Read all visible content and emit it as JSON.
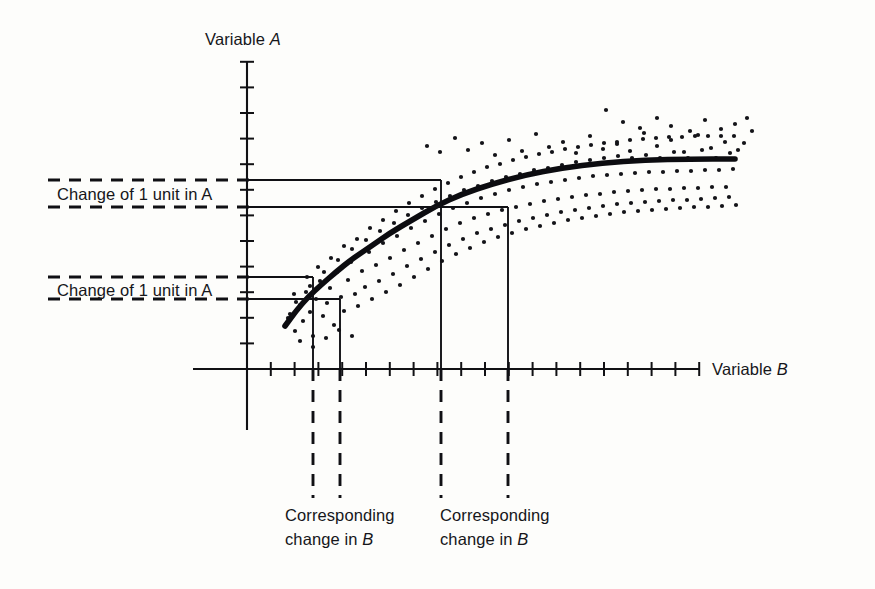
{
  "figure": {
    "background_color": "#fdfdfb",
    "ink_color": "#111114",
    "axis": {
      "y_label_prefix": "Variable ",
      "y_label_var": "A",
      "x_label_prefix": "Variable ",
      "x_label_var": "B"
    },
    "annotations": {
      "change_a_upper": "Change of 1 unit in A",
      "change_a_lower": "Change of 1 unit in A",
      "change_b_left_line1": "Corresponding",
      "change_b_left_line2_prefix": "change in ",
      "change_b_left_line2_var": "B",
      "change_b_right_line1": "Corresponding",
      "change_b_right_line2_prefix": "change in ",
      "change_b_right_line2_var": "B"
    }
  },
  "chart_data": {
    "type": "scatter",
    "title": "",
    "xlabel": "Variable B",
    "ylabel": "Variable A",
    "grid": false,
    "legend": false,
    "axis_style": "arrowless-ticked-cartesian",
    "x_axis": {
      "origin_px": 247,
      "end_px": 700,
      "tick_count": 19,
      "tick_spacing_px": 23.8,
      "tick_labels": []
    },
    "y_axis": {
      "origin_px": 369,
      "top_px": 62,
      "tick_count": 12,
      "tick_spacing_px": 25.6,
      "tick_labels": []
    },
    "fitted_curve": {
      "kind": "logarithmic",
      "points_px": [
        [
          285,
          326
        ],
        [
          296,
          311
        ],
        [
          308,
          297
        ],
        [
          321,
          285
        ],
        [
          336,
          272
        ],
        [
          352,
          259
        ],
        [
          370,
          247
        ],
        [
          390,
          233
        ],
        [
          412,
          220
        ],
        [
          436,
          206
        ],
        [
          462,
          194
        ],
        [
          492,
          184
        ],
        [
          525,
          175
        ],
        [
          562,
          168
        ],
        [
          602,
          163
        ],
        [
          645,
          160
        ],
        [
          690,
          159
        ],
        [
          735,
          159
        ]
      ]
    },
    "construction_lines": {
      "horizontal_levels_px": [
        180,
        207,
        277,
        299
      ],
      "vertical_drops_px": [
        313,
        340,
        441,
        508
      ],
      "left_pair_delta_b_px": 27,
      "right_pair_delta_b_px": 67,
      "note": "equal delta-A on the two bracketed pairs; delta-B is far larger on the right"
    },
    "scatter_points_px": [
      [
        288,
        318
      ],
      [
        295,
        331
      ],
      [
        300,
        305
      ],
      [
        303,
        321
      ],
      [
        306,
        292
      ],
      [
        310,
        312
      ],
      [
        313,
        336
      ],
      [
        316,
        299
      ],
      [
        320,
        281
      ],
      [
        323,
        316
      ],
      [
        327,
        303
      ],
      [
        330,
        288
      ],
      [
        334,
        325
      ],
      [
        337,
        272
      ],
      [
        341,
        297
      ],
      [
        344,
        311
      ],
      [
        348,
        280
      ],
      [
        351,
        262
      ],
      [
        355,
        294
      ],
      [
        358,
        306
      ],
      [
        362,
        271
      ],
      [
        365,
        287
      ],
      [
        369,
        252
      ],
      [
        372,
        299
      ],
      [
        376,
        265
      ],
      [
        379,
        281
      ],
      [
        383,
        243
      ],
      [
        386,
        292
      ],
      [
        390,
        258
      ],
      [
        393,
        274
      ],
      [
        397,
        236
      ],
      [
        400,
        285
      ],
      [
        404,
        250
      ],
      [
        407,
        266
      ],
      [
        411,
        228
      ],
      [
        414,
        277
      ],
      [
        418,
        243
      ],
      [
        421,
        259
      ],
      [
        425,
        221
      ],
      [
        428,
        269
      ],
      [
        432,
        236
      ],
      [
        435,
        252
      ],
      [
        439,
        214
      ],
      [
        442,
        261
      ],
      [
        446,
        229
      ],
      [
        449,
        245
      ],
      [
        453,
        208
      ],
      [
        456,
        254
      ],
      [
        460,
        223
      ],
      [
        463,
        239
      ],
      [
        467,
        203
      ],
      [
        470,
        248
      ],
      [
        474,
        218
      ],
      [
        477,
        233
      ],
      [
        481,
        198
      ],
      [
        484,
        242
      ],
      [
        488,
        214
      ],
      [
        491,
        229
      ],
      [
        495,
        194
      ],
      [
        498,
        237
      ],
      [
        502,
        210
      ],
      [
        505,
        225
      ],
      [
        509,
        190
      ],
      [
        512,
        233
      ],
      [
        516,
        207
      ],
      [
        519,
        221
      ],
      [
        523,
        187
      ],
      [
        526,
        229
      ],
      [
        530,
        204
      ],
      [
        533,
        218
      ],
      [
        537,
        184
      ],
      [
        540,
        226
      ],
      [
        544,
        201
      ],
      [
        547,
        215
      ],
      [
        551,
        182
      ],
      [
        554,
        223
      ],
      [
        558,
        199
      ],
      [
        561,
        212
      ],
      [
        565,
        180
      ],
      [
        568,
        220
      ],
      [
        572,
        197
      ],
      [
        575,
        210
      ],
      [
        579,
        178
      ],
      [
        582,
        218
      ],
      [
        586,
        195
      ],
      [
        589,
        208
      ],
      [
        593,
        176
      ],
      [
        596,
        216
      ],
      [
        600,
        194
      ],
      [
        603,
        206
      ],
      [
        607,
        175
      ],
      [
        610,
        214
      ],
      [
        614,
        192
      ],
      [
        617,
        204
      ],
      [
        621,
        174
      ],
      [
        624,
        212
      ],
      [
        628,
        191
      ],
      [
        631,
        203
      ],
      [
        635,
        173
      ],
      [
        638,
        211
      ],
      [
        642,
        190
      ],
      [
        645,
        202
      ],
      [
        649,
        172
      ],
      [
        652,
        210
      ],
      [
        656,
        189
      ],
      [
        659,
        201
      ],
      [
        663,
        172
      ],
      [
        666,
        209
      ],
      [
        670,
        189
      ],
      [
        673,
        200
      ],
      [
        677,
        171
      ],
      [
        680,
        208
      ],
      [
        684,
        188
      ],
      [
        687,
        200
      ],
      [
        691,
        171
      ],
      [
        694,
        207
      ],
      [
        698,
        188
      ],
      [
        701,
        199
      ],
      [
        705,
        170
      ],
      [
        708,
        207
      ],
      [
        712,
        187
      ],
      [
        715,
        198
      ],
      [
        719,
        170
      ],
      [
        722,
        206
      ],
      [
        726,
        187
      ],
      [
        729,
        197
      ],
      [
        733,
        169
      ],
      [
        736,
        205
      ],
      [
        427,
        146
      ],
      [
        440,
        152
      ],
      [
        455,
        138
      ],
      [
        468,
        150
      ],
      [
        482,
        143
      ],
      [
        495,
        155
      ],
      [
        509,
        140
      ],
      [
        522,
        151
      ],
      [
        536,
        134
      ],
      [
        549,
        147
      ],
      [
        563,
        142
      ],
      [
        576,
        153
      ],
      [
        590,
        136
      ],
      [
        603,
        149
      ],
      [
        617,
        144
      ],
      [
        630,
        151
      ],
      [
        644,
        133
      ],
      [
        657,
        146
      ],
      [
        671,
        140
      ],
      [
        684,
        152
      ],
      [
        698,
        135
      ],
      [
        711,
        148
      ],
      [
        725,
        142
      ],
      [
        738,
        150
      ],
      [
        606,
        110
      ],
      [
        623,
        122
      ],
      [
        640,
        128
      ],
      [
        657,
        118
      ],
      [
        671,
        126
      ],
      [
        690,
        131
      ],
      [
        705,
        120
      ],
      [
        721,
        129
      ],
      [
        735,
        124
      ],
      [
        747,
        118
      ],
      [
        752,
        131
      ],
      [
        744,
        143
      ],
      [
        730,
        153
      ],
      [
        716,
        158
      ],
      [
        702,
        150
      ],
      [
        688,
        158
      ],
      [
        674,
        152
      ],
      [
        660,
        158
      ],
      [
        646,
        155
      ],
      [
        632,
        158
      ],
      [
        618,
        156
      ],
      [
        604,
        158
      ],
      [
        590,
        160
      ],
      [
        576,
        162
      ],
      [
        562,
        165
      ],
      [
        548,
        168
      ],
      [
        534,
        170
      ],
      [
        520,
        174
      ],
      [
        506,
        177
      ],
      [
        492,
        181
      ],
      [
        478,
        186
      ],
      [
        464,
        190
      ],
      [
        450,
        196
      ],
      [
        436,
        202
      ],
      [
        422,
        208
      ],
      [
        408,
        215
      ],
      [
        394,
        223
      ],
      [
        380,
        231
      ],
      [
        366,
        240
      ],
      [
        352,
        249
      ],
      [
        338,
        260
      ],
      [
        324,
        272
      ],
      [
        310,
        286
      ],
      [
        296,
        302
      ],
      [
        290,
        314
      ],
      [
        300,
        341
      ],
      [
        313,
        347
      ],
      [
        326,
        338
      ],
      [
        339,
        330
      ],
      [
        352,
        336
      ],
      [
        294,
        294
      ],
      [
        307,
        277
      ],
      [
        318,
        267
      ],
      [
        331,
        258
      ],
      [
        344,
        246
      ],
      [
        357,
        239
      ],
      [
        370,
        228
      ],
      [
        383,
        220
      ],
      [
        396,
        211
      ],
      [
        409,
        203
      ],
      [
        422,
        196
      ],
      [
        435,
        189
      ],
      [
        448,
        183
      ],
      [
        461,
        177
      ],
      [
        474,
        172
      ],
      [
        487,
        167
      ],
      [
        500,
        164
      ],
      [
        513,
        160
      ],
      [
        526,
        157
      ],
      [
        539,
        154
      ],
      [
        552,
        152
      ],
      [
        565,
        149
      ],
      [
        578,
        147
      ],
      [
        591,
        145
      ],
      [
        604,
        143
      ],
      [
        617,
        142
      ],
      [
        630,
        140
      ],
      [
        643,
        139
      ],
      [
        656,
        138
      ],
      [
        669,
        137
      ],
      [
        682,
        137
      ],
      [
        695,
        136
      ],
      [
        708,
        136
      ],
      [
        721,
        136
      ],
      [
        734,
        136
      ]
    ]
  }
}
